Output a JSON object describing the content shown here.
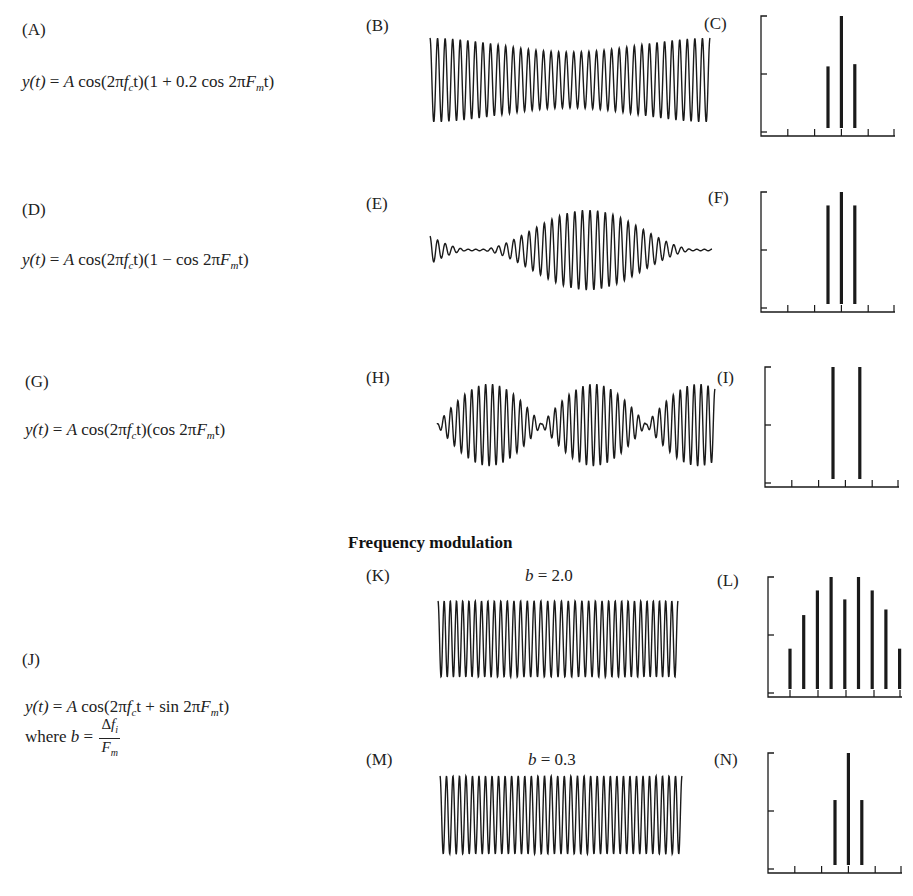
{
  "figure": {
    "section_title": "Frequency modulation",
    "colors": {
      "ink": "#1a1a1a",
      "background": "#ffffff"
    }
  },
  "rows": [
    {
      "id": "A",
      "wave_id": "B",
      "spec_id": "C",
      "label": "(A)",
      "wave_label": "(B)",
      "spec_label": "(C)",
      "equation": {
        "lhs": "y(t)",
        "eq": " = ",
        "A": "A",
        "body1": " cos(2π",
        "f": "f",
        "fsub": "c",
        "body2": "t)(1 + 0.2 cos 2π",
        "F": "F",
        "Fsub": "m",
        "body3": "t)"
      },
      "type": "AM",
      "mod_depth": 0.2
    },
    {
      "id": "D",
      "wave_id": "E",
      "spec_id": "F",
      "label": "(D)",
      "wave_label": "(E)",
      "spec_label": "(F)",
      "equation": {
        "lhs": "y(t)",
        "eq": " = ",
        "A": "A",
        "body1": " cos(2π",
        "f": "f",
        "fsub": "c",
        "body2": "t)(1 − cos 2π",
        "F": "F",
        "Fsub": "m",
        "body3": "t)"
      },
      "type": "AM",
      "mod_depth": 1.0
    },
    {
      "id": "G",
      "wave_id": "H",
      "spec_id": "I",
      "label": "(G)",
      "wave_label": "(H)",
      "spec_label": "(I)",
      "equation": {
        "lhs": "y(t)",
        "eq": " = ",
        "A": "A",
        "body1": " cos(2π",
        "f": "f",
        "fsub": "c",
        "body2": "t)(cos 2π",
        "F": "F",
        "Fsub": "m",
        "body3": "t)"
      },
      "type": "DSB"
    }
  ],
  "fm": {
    "label": "(J)",
    "equation": {
      "lhs": "y(t)",
      "eq": " = ",
      "A": "A",
      "body1": " cos(2π",
      "f": "f",
      "fsub": "c",
      "body2": "t + sin 2π",
      "F": "F",
      "Fsub": "m",
      "body3": "t)"
    },
    "where": {
      "prefix": "where ",
      "b": "b",
      "eq": " =",
      "num_delta": "Δ",
      "num_f": "f",
      "num_sub": "i",
      "den_F": "F",
      "den_sub": "m"
    },
    "panels": [
      {
        "wave_label": "(K)",
        "spec_label": "(L)",
        "b_var": "b",
        "b_value": " = 2.0"
      },
      {
        "wave_label": "(M)",
        "spec_label": "(N)",
        "b_var": "b",
        "b_value": " = 0.3"
      }
    ]
  },
  "chart_data": [
    {
      "id": "B",
      "type": "line",
      "title": "(B)",
      "description": "AM waveform, modulation depth 0.2",
      "cycles": 37,
      "envelope": "1 + 0.2 cos(2πFm t)"
    },
    {
      "id": "C",
      "type": "bar",
      "title": "(C)",
      "categories": [
        "fc−Fm",
        "fc",
        "fc+Fm"
      ],
      "values": [
        0.55,
        1.0,
        0.57
      ],
      "x_ticks": 6,
      "y_ticks": 3,
      "ylim": [
        0,
        1
      ]
    },
    {
      "id": "E",
      "type": "line",
      "title": "(E)",
      "description": "AM waveform, 100% modulation",
      "cycles": 37,
      "envelope": "1 − cos(2πFm t)"
    },
    {
      "id": "F",
      "type": "bar",
      "title": "(F)",
      "categories": [
        "fc−Fm",
        "fc",
        "fc+Fm"
      ],
      "values": [
        0.88,
        1.0,
        0.88
      ],
      "x_ticks": 6,
      "y_ticks": 3,
      "ylim": [
        0,
        1
      ]
    },
    {
      "id": "H",
      "type": "line",
      "title": "(H)",
      "description": "Double-sideband suppressed-carrier waveform",
      "cycles": 40,
      "envelope": "cos(2πFm t)"
    },
    {
      "id": "I",
      "type": "bar",
      "title": "(I)",
      "categories": [
        "fc−Fm",
        "fc+Fm"
      ],
      "values": [
        1.0,
        1.0
      ],
      "x_ticks": 6,
      "y_ticks": 3,
      "ylim": [
        0,
        1
      ]
    },
    {
      "id": "K",
      "type": "line",
      "title": "(K) b = 2.0",
      "description": "FM waveform, b = 2.0",
      "cycles": 37
    },
    {
      "id": "L",
      "type": "bar",
      "title": "(L)",
      "categories": [
        "fc−4Fm",
        "fc−3Fm",
        "fc−2Fm",
        "fc−Fm",
        "fc",
        "fc+Fm",
        "fc+2Fm",
        "fc+3Fm",
        "fc+4Fm"
      ],
      "values": [
        0.36,
        0.66,
        0.88,
        1.0,
        0.8,
        1.0,
        0.88,
        0.71,
        0.36
      ],
      "x_ticks": 5,
      "y_ticks": 3,
      "ylim": [
        0,
        1
      ]
    },
    {
      "id": "M",
      "type": "line",
      "title": "(M) b = 0.3",
      "description": "FM waveform, b = 0.3",
      "cycles": 37
    },
    {
      "id": "N",
      "type": "bar",
      "title": "(N)",
      "categories": [
        "fc−Fm",
        "fc",
        "fc+Fm"
      ],
      "values": [
        0.58,
        1.0,
        0.58
      ],
      "x_ticks": 6,
      "y_ticks": 3,
      "ylim": [
        0,
        1
      ]
    }
  ]
}
